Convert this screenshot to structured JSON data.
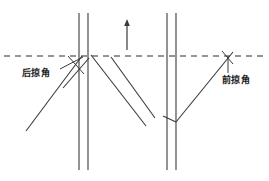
{
  "diagram": {
    "canvas": {
      "width": 269,
      "height": 181
    },
    "colors": {
      "background": "#ffffff",
      "line": "#3a3a3a",
      "dashed_line": "#2b2b2b",
      "text": "#1a1a1a"
    },
    "reference_line": {
      "name": "chord-reference-line",
      "style": "dashed",
      "y": 56,
      "x_start": 4,
      "x_end": 266,
      "dash_pattern": "6 5"
    },
    "flow_arrow": {
      "name": "flow-direction-arrow",
      "direction": "up",
      "x": 127,
      "y_tail": 50,
      "y_tip": 19
    },
    "left_fuselage": {
      "name": "left-vertical-pair",
      "x1": 79,
      "x2": 88,
      "y_top": 13,
      "y_bottom": 170
    },
    "right_fuselage": {
      "name": "right-vertical-pair",
      "x1": 167,
      "x2": 176,
      "y_top": 13,
      "y_bottom": 170
    },
    "swept_lines": [
      {
        "name": "left-wing-leading-edge",
        "x1": 82,
        "y1": 56,
        "x2": 26,
        "y2": 131
      },
      {
        "name": "left-wing-trailing-edge",
        "x1": 89,
        "y1": 58,
        "x2": 63,
        "y2": 88
      },
      {
        "name": "center-wing-leading-edge",
        "x1": 91,
        "y1": 55,
        "x2": 146,
        "y2": 126
      },
      {
        "name": "center-wing-trailing-edge",
        "x1": 111,
        "y1": 57,
        "x2": 155,
        "y2": 118
      },
      {
        "name": "right-wing-forward-sweep",
        "x1": 176,
        "y1": 122,
        "x2": 233,
        "y2": 52
      },
      {
        "name": "right-wing-inner-edge",
        "x1": 163,
        "y1": 116,
        "x2": 176,
        "y2": 122
      }
    ],
    "labels": [
      {
        "name": "backward-sweep-angle-label",
        "text": "后掠角",
        "x": 22,
        "y": 76,
        "leader": {
          "x1": 60,
          "y1": 69,
          "x2": 83,
          "y2": 57
        }
      },
      {
        "name": "forward-sweep-angle-label",
        "text": "前掠角",
        "x": 222,
        "y": 83,
        "leader": {
          "x1": 228,
          "y1": 73,
          "x2": 228,
          "y2": 56
        }
      }
    ],
    "angle_marks": [
      {
        "name": "backward-angle-vertex-mark",
        "x1": 68,
        "y1": 56,
        "x2": 84,
        "y2": 74
      },
      {
        "name": "forward-angle-vertex-mark",
        "x1": 222,
        "y1": 51,
        "x2": 233,
        "y2": 64
      }
    ]
  }
}
